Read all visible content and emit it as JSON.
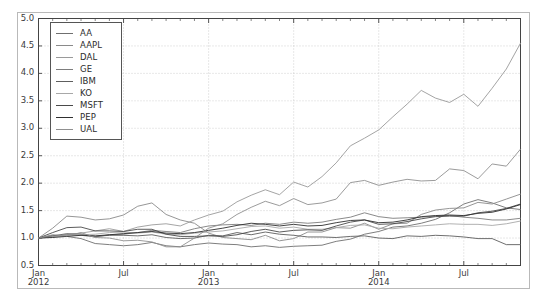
{
  "chart_data": {
    "type": "line",
    "title": "",
    "xlabel": "",
    "ylabel": "",
    "ylim": [
      0.5,
      5.0
    ],
    "yticks": [
      "0.5",
      "1.0",
      "1.5",
      "2.0",
      "2.5",
      "3.0",
      "3.5",
      "4.0",
      "4.5",
      "5.0"
    ],
    "xticks": [
      "Jan\n2012",
      "Jul",
      "Jan\n2013",
      "Jul",
      "Jan\n2014",
      "Jul"
    ],
    "xtick_positions": [
      0,
      6,
      12,
      18,
      24,
      30
    ],
    "x": [
      "2012-01",
      "2012-02",
      "2012-03",
      "2012-04",
      "2012-05",
      "2012-06",
      "2012-07",
      "2012-08",
      "2012-09",
      "2012-10",
      "2012-11",
      "2012-12",
      "2013-01",
      "2013-02",
      "2013-03",
      "2013-04",
      "2013-05",
      "2013-06",
      "2013-07",
      "2013-08",
      "2013-09",
      "2013-10",
      "2013-11",
      "2013-12",
      "2014-01",
      "2014-02",
      "2014-03",
      "2014-04",
      "2014-05",
      "2014-06",
      "2014-07",
      "2014-08",
      "2014-09",
      "2014-10",
      "2014-11"
    ],
    "grid": true,
    "legend_position": "upper left",
    "series": [
      {
        "name": "AA",
        "color": "#6f6f6f",
        "values": [
          1.0,
          1.05,
          1.03,
          0.99,
          0.9,
          0.88,
          0.86,
          0.88,
          0.92,
          0.86,
          0.84,
          0.88,
          0.91,
          0.89,
          0.88,
          0.84,
          0.86,
          0.83,
          0.85,
          0.86,
          0.87,
          0.94,
          0.98,
          1.07,
          1.12,
          1.2,
          1.22,
          1.27,
          1.34,
          1.46,
          1.62,
          1.7,
          1.64,
          1.55,
          1.52
        ]
      },
      {
        "name": "AAPL",
        "color": "#8a8a8a",
        "values": [
          1.0,
          1.18,
          1.4,
          1.38,
          1.33,
          1.35,
          1.42,
          1.58,
          1.64,
          1.43,
          1.33,
          1.27,
          1.09,
          1.01,
          0.99,
          0.97,
          1.05,
          0.95,
          0.99,
          1.11,
          1.11,
          1.19,
          1.18,
          1.27,
          1.16,
          1.26,
          1.27,
          1.43,
          1.51,
          1.54,
          1.55,
          1.65,
          1.62,
          1.71,
          1.8
        ]
      },
      {
        "name": "DAL",
        "color": "#9a9a9a",
        "values": [
          1.0,
          1.02,
          1.06,
          1.09,
          1.13,
          1.17,
          1.12,
          1.2,
          1.24,
          1.26,
          1.22,
          1.33,
          1.42,
          1.49,
          1.66,
          1.78,
          1.88,
          1.79,
          2.02,
          1.93,
          2.12,
          2.37,
          2.68,
          2.82,
          2.97,
          3.21,
          3.44,
          3.69,
          3.55,
          3.47,
          3.62,
          3.4,
          3.73,
          4.08,
          4.55
        ]
      },
      {
        "name": "GE",
        "color": "#7d7d7d",
        "values": [
          1.0,
          1.03,
          1.06,
          1.05,
          1.02,
          1.06,
          1.07,
          1.1,
          1.14,
          1.12,
          1.1,
          1.17,
          1.22,
          1.24,
          1.25,
          1.23,
          1.27,
          1.25,
          1.29,
          1.27,
          1.29,
          1.34,
          1.38,
          1.46,
          1.39,
          1.36,
          1.37,
          1.38,
          1.4,
          1.41,
          1.38,
          1.36,
          1.33,
          1.33,
          1.36
        ]
      },
      {
        "name": "IBM",
        "color": "#5e5e5e",
        "values": [
          1.0,
          1.04,
          1.08,
          1.07,
          1.03,
          1.05,
          1.05,
          1.04,
          1.06,
          1.01,
          0.99,
          1.0,
          1.05,
          1.04,
          1.1,
          1.06,
          1.11,
          1.07,
          1.05,
          1.02,
          1.02,
          1.01,
          1.03,
          1.04,
          1.0,
          0.99,
          1.04,
          1.03,
          1.05,
          1.04,
          1.02,
          0.99,
          0.99,
          0.88,
          0.88
        ]
      },
      {
        "name": "KO",
        "color": "#a8a8a8",
        "values": [
          1.0,
          1.02,
          1.05,
          1.06,
          1.07,
          1.1,
          1.11,
          1.09,
          1.11,
          1.07,
          1.06,
          1.09,
          1.11,
          1.13,
          1.17,
          1.21,
          1.22,
          1.18,
          1.2,
          1.16,
          1.16,
          1.19,
          1.23,
          1.24,
          1.18,
          1.17,
          1.2,
          1.22,
          1.24,
          1.26,
          1.25,
          1.25,
          1.23,
          1.26,
          1.31
        ]
      },
      {
        "name": "MSFT",
        "color": "#4a4a4a",
        "values": [
          1.0,
          1.1,
          1.19,
          1.2,
          1.13,
          1.13,
          1.12,
          1.16,
          1.16,
          1.07,
          1.03,
          1.03,
          1.04,
          1.03,
          1.06,
          1.12,
          1.16,
          1.11,
          1.14,
          1.15,
          1.14,
          1.22,
          1.29,
          1.33,
          1.25,
          1.26,
          1.3,
          1.35,
          1.39,
          1.4,
          1.4,
          1.46,
          1.49,
          1.54,
          1.62
        ]
      },
      {
        "name": "PEP",
        "color": "#2f2f2f",
        "values": [
          1.0,
          1.01,
          1.03,
          1.05,
          1.04,
          1.06,
          1.08,
          1.1,
          1.12,
          1.09,
          1.08,
          1.1,
          1.14,
          1.18,
          1.23,
          1.27,
          1.25,
          1.22,
          1.25,
          1.22,
          1.23,
          1.28,
          1.32,
          1.33,
          1.28,
          1.29,
          1.33,
          1.39,
          1.41,
          1.42,
          1.41,
          1.45,
          1.47,
          1.53,
          1.61
        ]
      },
      {
        "name": "UAL",
        "color": "#909090",
        "values": [
          1.0,
          1.06,
          1.04,
          1.1,
          1.01,
          1.0,
          0.95,
          0.96,
          0.93,
          0.84,
          0.84,
          1.0,
          1.18,
          1.26,
          1.43,
          1.56,
          1.67,
          1.59,
          1.72,
          1.61,
          1.64,
          1.71,
          2.01,
          2.05,
          1.96,
          2.02,
          2.07,
          2.04,
          2.05,
          2.26,
          2.23,
          2.08,
          2.35,
          2.31,
          2.62
        ]
      }
    ]
  }
}
